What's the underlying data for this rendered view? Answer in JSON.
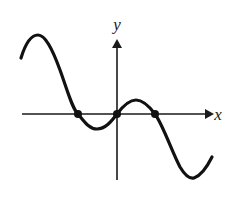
{
  "figure": {
    "type": "math-graph",
    "background_color": "#ffffff",
    "curve_color": "#111111",
    "axis_color": "#1a1a1a",
    "width": 237,
    "height": 203
  },
  "axes": {
    "x_label": "x",
    "y_label": "y",
    "x_axis": {
      "start_x": 22,
      "end_x": 210,
      "y": 114,
      "arrow": "right"
    },
    "y_axis": {
      "x": 117,
      "start_y": 180,
      "end_y": 42,
      "arrow": "up"
    },
    "origin": {
      "x": 117,
      "y": 114
    }
  },
  "chart_data": {
    "type": "line",
    "title": "",
    "xlabel": "x",
    "ylabel": "y",
    "grid": false,
    "legend": "none",
    "axis_units_per_pixel": {
      "x": 1,
      "y": 1
    },
    "curve_points_px": [
      {
        "x": 21,
        "y": 58,
        "role": "left-endpoint"
      },
      {
        "x": 37,
        "y": 35,
        "role": "local-maximum"
      },
      {
        "x": 78,
        "y": 114,
        "role": "x-intercept"
      },
      {
        "x": 98,
        "y": 129,
        "role": "local-minimum"
      },
      {
        "x": 117,
        "y": 114,
        "role": "x-intercept-origin"
      },
      {
        "x": 136,
        "y": 100,
        "role": "local-maximum"
      },
      {
        "x": 155,
        "y": 114,
        "role": "x-intercept"
      },
      {
        "x": 192,
        "y": 178,
        "role": "local-minimum"
      },
      {
        "x": 212,
        "y": 157,
        "role": "right-endpoint"
      }
    ],
    "marked_points_px": [
      {
        "x": 78,
        "y": 114,
        "label": "root-left"
      },
      {
        "x": 117,
        "y": 114,
        "label": "root-origin"
      },
      {
        "x": 155,
        "y": 114,
        "label": "root-right"
      }
    ],
    "marked_point_radius_px": 4,
    "path_d": "M 21 58 C 25 45, 31 35, 38 35 C 45 35, 52 48, 60 70 C 68 92, 72 108, 78 114 C 84 121, 89 129, 97 129 C 105 129, 111 122, 117 114 C 123 106, 129 100, 136 100 C 143 100, 149 106, 155 114 C 163 125, 172 152, 180 167 C 186 177, 190 179, 194 178 C 200 176, 207 167, 212 157"
  }
}
